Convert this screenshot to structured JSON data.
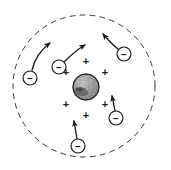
{
  "figure": {
    "width": 171,
    "height": 170,
    "background_color": "#ffffff",
    "ink_color": "#1a1a1a"
  },
  "boundary": {
    "name": "atom-boundary",
    "shape": "circle",
    "cx": 84,
    "cy": 86,
    "r": 71,
    "stroke_color": "#3a3a3a",
    "stroke_width": 1,
    "dash_pattern": "5 5"
  },
  "nucleus": {
    "name": "nucleus",
    "shape": "circle",
    "cx": 86,
    "cy": 87,
    "r": 13,
    "fill_color": "#b5b5b5",
    "stroke_color": "#2b2b2b",
    "texture": "stippled"
  },
  "positive_charges": {
    "symbol": "+",
    "count": 6,
    "color": "#1a1a1a",
    "items": [
      {
        "label": "+",
        "x": 86,
        "y": 61
      },
      {
        "label": "+",
        "x": 66,
        "y": 72
      },
      {
        "label": "+",
        "x": 105,
        "y": 72
      },
      {
        "label": "+",
        "x": 66,
        "y": 104
      },
      {
        "label": "+",
        "x": 105,
        "y": 104
      },
      {
        "label": "+",
        "x": 86,
        "y": 115
      }
    ]
  },
  "electrons": {
    "symbol": "−",
    "count": 5,
    "circle_r": 7,
    "stroke_color": "#1a1a1a",
    "items": [
      {
        "id": "electron-left",
        "label": "−",
        "cx": 30,
        "cy": 78,
        "arrow_path": "M 32 70 C 35 57 42 49 50 43",
        "arrow_tip": {
          "x": 50,
          "y": 43,
          "angle": -43
        }
      },
      {
        "id": "electron-upper-left",
        "label": "−",
        "cx": 59,
        "cy": 67,
        "arrow_path": "M 64 62 C 71 55 78 49 85 45",
        "arrow_tip": {
          "x": 85,
          "y": 45,
          "angle": -31
        }
      },
      {
        "id": "electron-upper-right",
        "label": "−",
        "cx": 124,
        "cy": 54,
        "arrow_path": "M 119 50 C 112 44 107 39 103 34",
        "arrow_tip": {
          "x": 103,
          "y": 34,
          "angle": -130
        }
      },
      {
        "id": "electron-right",
        "label": "−",
        "cx": 116,
        "cy": 118,
        "arrow_path": "M 115 111 C 114 105 113 101 112 96",
        "arrow_tip": {
          "x": 112,
          "y": 96,
          "angle": -99
        }
      },
      {
        "id": "electron-bottom",
        "label": "−",
        "cx": 78,
        "cy": 146,
        "arrow_path": "M 77 139 C 76 132 75 127 74 121",
        "arrow_tip": {
          "x": 74,
          "y": 121,
          "angle": -100
        }
      }
    ]
  }
}
